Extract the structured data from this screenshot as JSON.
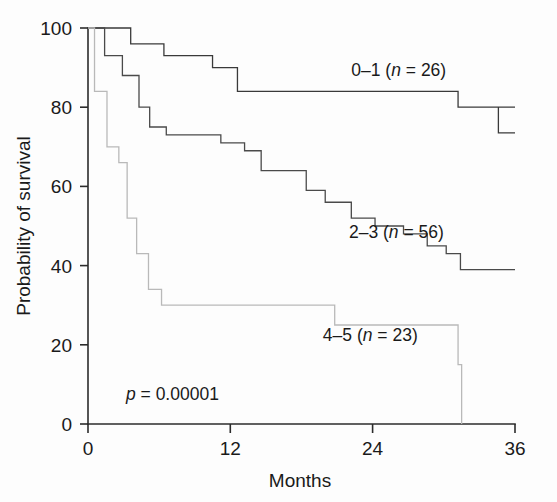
{
  "chart_data": {
    "type": "line",
    "title": "",
    "xlabel": "Months",
    "ylabel": "Probability of survival",
    "xlim": [
      0,
      36
    ],
    "ylim": [
      0,
      100
    ],
    "xticks": [
      "0",
      "12",
      "24",
      "36"
    ],
    "xtick_values": [
      0,
      12,
      24,
      36
    ],
    "yticks": [
      "0",
      "20",
      "40",
      "60",
      "80",
      "100"
    ],
    "ytick_values": [
      0,
      20,
      40,
      60,
      80,
      100
    ],
    "grid": false,
    "legend_position": "inline-right-of-curves",
    "annotations": [
      {
        "name": "p-value",
        "text_prefix": "p",
        "text_rest": " = 0.00001",
        "x": 3.2,
        "y": 6
      }
    ],
    "series": [
      {
        "name": "0-1",
        "label_prefix": "0–1 (",
        "label_italic": "n",
        "label_suffix": " = 26)",
        "n": 26,
        "color": "#3a3a3a",
        "label_x": 26.2,
        "label_y": 88,
        "step_x": [
          0,
          2.7,
          3.6,
          6.4,
          8.4,
          10.5,
          12.6,
          18.0,
          31.2,
          36
        ],
        "step_y": [
          100,
          100,
          96,
          93,
          93,
          90,
          84,
          84,
          80,
          80
        ],
        "final_y": 73.5,
        "final_drop_x": 34.6
      },
      {
        "name": "2-3",
        "label_prefix": "2–3 (",
        "label_italic": "n",
        "label_suffix": " = 56)",
        "n": 56,
        "color": "#4a4a4a",
        "label_x": 26.0,
        "label_y": 47,
        "step_x": [
          0,
          1.4,
          2.9,
          4.3,
          5.2,
          6.6,
          9.2,
          11.2,
          13.2,
          14.6,
          16.6,
          18.4,
          20.0,
          22.2,
          24.2,
          26.6,
          28.6,
          30.2,
          31.4,
          36
        ],
        "step_y": [
          100,
          93,
          88,
          80,
          75,
          73,
          73,
          71,
          69,
          64,
          64,
          59,
          56,
          52,
          50,
          48,
          45,
          43,
          39,
          39
        ]
      },
      {
        "name": "4-5",
        "label_prefix": "4–5 (",
        "label_italic": "n",
        "label_suffix": " = 23)",
        "n": 23,
        "color": "#b9b9b9",
        "label_x": 23.8,
        "label_y": 21,
        "step_x": [
          0,
          0.55,
          1.6,
          2.6,
          3.3,
          4.1,
          5.1,
          6.2,
          15.8,
          20.8,
          31.2,
          31.5
        ],
        "step_y": [
          100,
          84,
          70,
          66,
          52,
          43,
          34,
          30,
          30,
          25,
          15,
          0
        ]
      }
    ]
  },
  "plot_geometry": {
    "left_px": 88,
    "right_px": 515,
    "top_px": 28,
    "bottom_px": 424
  }
}
